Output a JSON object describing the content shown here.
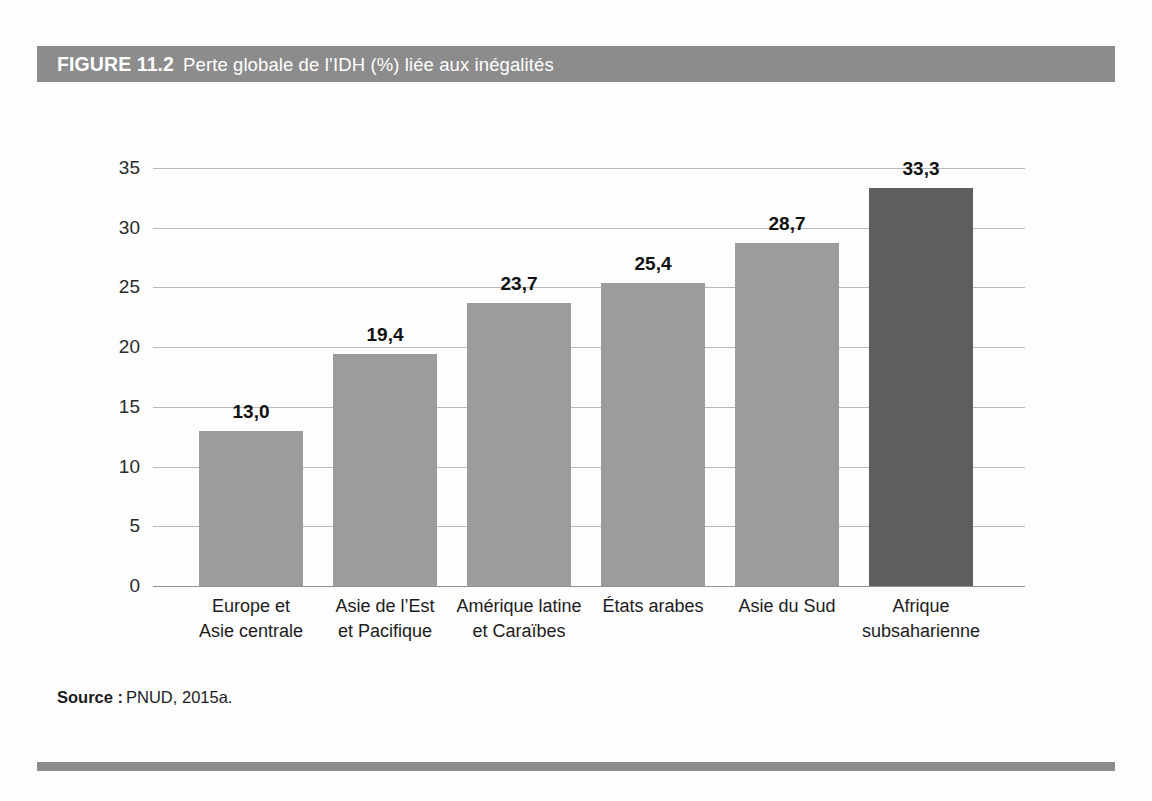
{
  "figure": {
    "label": "FIGURE 11.2",
    "title": "Perte globale de l’IDH (%) liée aux inégalités",
    "band_color": "#8c8c8c",
    "band_text_color": "#ffffff"
  },
  "source": {
    "label": "Source :",
    "value": "PNUD, 2015a."
  },
  "chart_data": {
    "type": "bar",
    "title": "Perte globale de l’IDH (%) liée aux inégalités",
    "xlabel": "",
    "ylabel": "",
    "ylim": [
      0,
      35
    ],
    "yticks": [
      0,
      5,
      10,
      15,
      20,
      25,
      30,
      35
    ],
    "ytick_labels": [
      "0",
      "5",
      "10",
      "15",
      "20",
      "25",
      "30",
      "35"
    ],
    "grid": true,
    "legend": "none",
    "orientation": "vertical",
    "decimal_separator": ",",
    "bar_color": "#9c9c9c",
    "highlight_color": "#5e5e5e",
    "categories": [
      "Europe et Asie centrale",
      "Asie de l’Est et Pacifique",
      "Amérique latine et Caraïbes",
      "États arabes",
      "Asie du Sud",
      "Afrique subsaharienne"
    ],
    "category_lines": [
      [
        "Europe et",
        "Asie centrale"
      ],
      [
        "Asie de l’Est",
        "et Pacifique"
      ],
      [
        "Amérique latine",
        "et Caraïbes"
      ],
      [
        "États arabes",
        ""
      ],
      [
        "Asie du Sud",
        ""
      ],
      [
        "Afrique",
        "subsaharienne"
      ]
    ],
    "values": [
      13.0,
      19.4,
      23.7,
      25.4,
      28.7,
      33.3
    ],
    "value_labels": [
      "13,0",
      "19,4",
      "23,7",
      "25,4",
      "28,7",
      "33,3"
    ],
    "highlight_index": 5
  }
}
